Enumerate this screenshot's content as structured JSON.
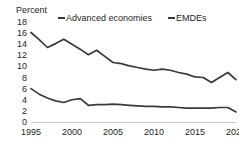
{
  "chart_data": {
    "type": "line",
    "title": "",
    "ylabel": "Percent",
    "xlabel": "",
    "ylim": [
      0,
      18
    ],
    "xlim": [
      1995,
      2020
    ],
    "grid": false,
    "legend_position": "top",
    "yticks": [
      "18",
      "16",
      "14",
      "12",
      "10",
      "8",
      "6",
      "4",
      "2",
      "0"
    ],
    "xticks": [
      "1995",
      "2000",
      "2005",
      "2010",
      "2015",
      "2020"
    ],
    "x": [
      1995,
      1996,
      1997,
      1998,
      1999,
      2000,
      2001,
      2002,
      2003,
      2004,
      2005,
      2006,
      2007,
      2008,
      2009,
      2010,
      2011,
      2012,
      2013,
      2014,
      2015,
      2016,
      2017,
      2018,
      2019,
      2020
    ],
    "series": [
      {
        "name": "EMDEs",
        "color": "#3a3a3a",
        "values": [
          16.2,
          14.9,
          13.5,
          14.2,
          15.0,
          14.1,
          13.2,
          12.2,
          13.0,
          11.9,
          10.8,
          10.6,
          10.2,
          9.9,
          9.6,
          9.4,
          9.6,
          9.4,
          9.0,
          8.7,
          8.2,
          8.1,
          7.2,
          8.1,
          9.0,
          7.7
        ]
      },
      {
        "name": "Advanced economies",
        "color": "#3a3a3a",
        "values": [
          6.1,
          5.1,
          4.4,
          3.9,
          3.6,
          4.1,
          4.3,
          3.1,
          3.2,
          3.2,
          3.3,
          3.2,
          3.1,
          3.0,
          2.9,
          2.9,
          2.8,
          2.8,
          2.7,
          2.6,
          2.6,
          2.6,
          2.6,
          2.7,
          2.7,
          1.9
        ]
      }
    ]
  },
  "legend": {
    "entries": [
      {
        "label": "Advanced economies"
      },
      {
        "label": "EMDEs"
      }
    ]
  }
}
